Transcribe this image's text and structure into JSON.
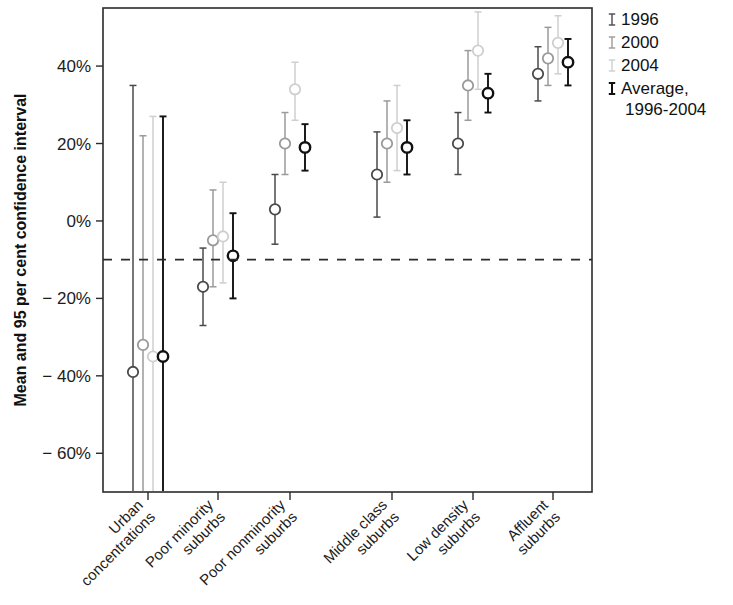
{
  "figure": {
    "background_color": "#ffffff",
    "frame_color": "#2b2b2b"
  },
  "legend": {
    "position": "right",
    "entries": [
      {
        "label": "1996",
        "color": "#4a4a4a",
        "marker": "error-bar-i"
      },
      {
        "label": "2000",
        "color": "#9a9a9a",
        "marker": "error-bar-i"
      },
      {
        "label": "2004",
        "color": "#cfcfcf",
        "marker": "error-bar-i"
      },
      {
        "label": "Average,",
        "label2": "1996-2004",
        "color": "#111111",
        "marker": "error-bar-i"
      }
    ]
  },
  "chart_data": {
    "type": "scatter",
    "title": "",
    "subtitle": "",
    "xlabel": "",
    "ylabel": "Mean and 95 per cent confidence interval",
    "ylim": [
      -70,
      55
    ],
    "yticks": [
      40,
      20,
      0,
      -20,
      -40,
      -60
    ],
    "ytick_labels": [
      "40%",
      "20%",
      "0%",
      "− 20%",
      "− 40%",
      "− 60%"
    ],
    "grid": false,
    "reference_line": {
      "value": -10,
      "style": "dashed",
      "color": "#2b2b2b"
    },
    "categories": [
      "Urban concentrations",
      "Poor minority suburbs",
      "Poor nonminority suburbs",
      "Middle class suburbs",
      "Low density suburbs",
      "Affluent suburbs"
    ],
    "series": [
      {
        "name": "1996",
        "color": "#4a4a4a",
        "values": [
          -39,
          -17,
          3,
          12,
          20,
          38
        ],
        "ci_low": [
          -95,
          -27,
          -6,
          1,
          12,
          31
        ],
        "ci_high": [
          35,
          -7,
          12,
          23,
          28,
          45
        ]
      },
      {
        "name": "2000",
        "color": "#9a9a9a",
        "values": [
          -32,
          -5,
          20,
          20,
          35,
          42
        ],
        "ci_low": [
          -95,
          -17,
          12,
          10,
          26,
          35
        ],
        "ci_high": [
          22,
          8,
          28,
          31,
          44,
          50
        ]
      },
      {
        "name": "2004",
        "color": "#cfcfcf",
        "values": [
          -35,
          -4,
          34,
          24,
          44,
          46
        ],
        "ci_low": [
          -95,
          -16,
          26,
          13,
          34,
          38
        ],
        "ci_high": [
          27,
          10,
          41,
          35,
          54,
          53
        ]
      },
      {
        "name": "Average, 1996-2004",
        "color": "#111111",
        "values": [
          -35,
          -9,
          19,
          19,
          33,
          41
        ],
        "ci_low": [
          -95,
          -20,
          13,
          12,
          28,
          35
        ],
        "ci_high": [
          27,
          2,
          25,
          26,
          38,
          47
        ]
      }
    ]
  }
}
